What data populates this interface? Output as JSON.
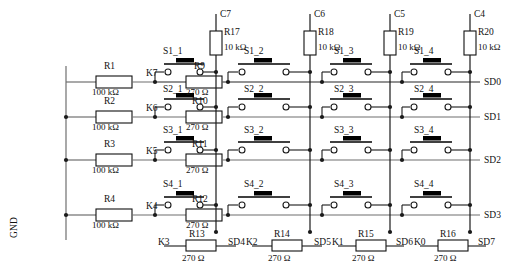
{
  "diagram": {
    "ground_label": "GND",
    "ohm": "Ω"
  },
  "colors": {
    "wire": "#6f6f6f",
    "wire_dark": "#1a1a1a",
    "component_stroke": "#111111",
    "button_fill": "#000000",
    "background": "#ffffff"
  },
  "pullup_resistors": [
    {
      "net": "C7",
      "ref": "R17",
      "value": "10 kΩ"
    },
    {
      "net": "C6",
      "ref": "R18",
      "value": "10 kΩ"
    },
    {
      "net": "C5",
      "ref": "R19",
      "value": "10 kΩ"
    },
    {
      "net": "C4",
      "ref": "R20",
      "value": "10 kΩ"
    }
  ],
  "row_drivers": [
    {
      "pull": "R1",
      "pull_value": "100 kΩ",
      "net": "K7",
      "series": "R9",
      "series_value": "270 Ω",
      "out": "SD0"
    },
    {
      "pull": "R2",
      "pull_value": "100 kΩ",
      "net": "K6",
      "series": "R10",
      "series_value": "270 Ω",
      "out": "SD1"
    },
    {
      "pull": "R3",
      "pull_value": "100 kΩ",
      "net": "K5",
      "series": "R11",
      "series_value": "270 Ω",
      "out": "SD2"
    },
    {
      "pull": "R4",
      "pull_value": "100 kΩ",
      "net": "K4",
      "series": "R12",
      "series_value": "270 Ω",
      "out": "SD3"
    }
  ],
  "switch_matrix": {
    "rows": 4,
    "cols": 4,
    "labels": [
      [
        "S1_1",
        "S1_2",
        "S1_3",
        "S1_4"
      ],
      [
        "S2_1",
        "S2_2",
        "S2_3",
        "S2_4"
      ],
      [
        "S3_1",
        "S3_2",
        "S3_3",
        "S3_4"
      ],
      [
        "S4_1",
        "S4_2",
        "S4_3",
        "S4_4"
      ]
    ]
  },
  "bottom_resistors": [
    {
      "net": "K3",
      "ref": "R13",
      "value": "270 Ω",
      "out": "SD4"
    },
    {
      "net": "K2",
      "ref": "R14",
      "value": "270 Ω",
      "out": "SD5"
    },
    {
      "net": "K1",
      "ref": "R15",
      "value": "270 Ω",
      "out": "SD6"
    },
    {
      "net": "K0",
      "ref": "R16",
      "value": "270 Ω",
      "out": "SD7"
    }
  ]
}
